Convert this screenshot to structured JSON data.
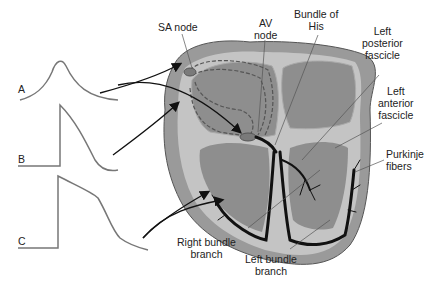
{
  "diagram": {
    "type": "anatomical-cross-section",
    "colors": {
      "outer_wall": "#9a9a9a",
      "myocardium": "#c4c4c4",
      "chamber": "#8e8e8e",
      "inner_lining": "#d8d8d8",
      "conduction_fiber": "#111111",
      "waveform": "#777777",
      "arrow": "#111111"
    },
    "waveforms": [
      {
        "label": "A",
        "description": "SA/AV nodal-type action potential (slow rounded upstroke)"
      },
      {
        "label": "B",
        "description": "Atrial muscle action potential (fast upstroke, short plateau)"
      },
      {
        "label": "C",
        "description": "Ventricular/Purkinje action potential (fast upstroke, long plateau)"
      }
    ],
    "labels": {
      "sa_node": "SA node",
      "av_node_line1": "AV",
      "av_node_line2": "node",
      "bundle_his_line1": "Bundle of",
      "bundle_his_line2": "His",
      "lpf_line1": "Left",
      "lpf_line2": "posterior",
      "lpf_line3": "fascicle",
      "laf_line1": "Left",
      "laf_line2": "anterior",
      "laf_line3": "fascicle",
      "purkinje_line1": "Purkinje",
      "purkinje_line2": "fibers",
      "rbb_line1": "Right bundle",
      "rbb_line2": "branch",
      "lbb_line1": "Left bundle",
      "lbb_line2": "branch"
    }
  }
}
